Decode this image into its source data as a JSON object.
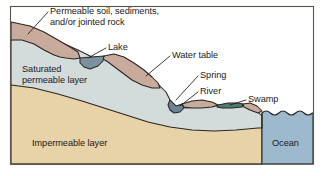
{
  "figure": {
    "background_color": "#ffffff",
    "frame_color": "#585249"
  },
  "layers": [
    {
      "id": "permeable-soil",
      "label": "Permeable soil, sediments,\nand/or jointed rock",
      "label_line_1": "Permeable soil, sediments,",
      "label_line_2": "and/or jointed rock",
      "color": "#c9ab9c",
      "label_placement": "external-leader"
    },
    {
      "id": "saturated-permeable",
      "label": "Saturated\npermeable layer",
      "label_line_1": "Saturated",
      "label_line_2": "permeable layer",
      "color": "#d3dbdb",
      "label_placement": "internal"
    },
    {
      "id": "impermeable",
      "label": "Impermeable layer",
      "label_line_1": "Impermeable layer",
      "color": "#e8d2a8",
      "label_placement": "internal"
    }
  ],
  "water_bodies": [
    {
      "id": "lake",
      "label": "Lake",
      "color": "#7b91a0"
    },
    {
      "id": "river",
      "label": "River",
      "color": "#6b8496"
    },
    {
      "id": "swamp",
      "label": "Swamp",
      "color": "#4e7a74"
    },
    {
      "id": "ocean",
      "label": "Ocean",
      "color": "#9cb9ce"
    }
  ],
  "features": [
    {
      "id": "water-table",
      "label": "Water table"
    },
    {
      "id": "spring",
      "label": "Spring"
    }
  ],
  "labels": {
    "permeable_soil_l1": "Permeable soil, sediments,",
    "permeable_soil_l2": "and/or jointed rock",
    "lake": "Lake",
    "water_table": "Water table",
    "spring": "Spring",
    "river": "River",
    "swamp": "Swamp",
    "ocean": "Ocean",
    "saturated_l1": "Saturated",
    "saturated_l2": "permeable layer",
    "impermeable": "Impermeable layer"
  },
  "colors": {
    "outline": "#2b2521",
    "text": "#1a1a1a",
    "permeable_soil": "#c9ab9c",
    "saturated": "#d3dbdb",
    "impermeable": "#e8d2a8",
    "ocean": "#9cb9ce",
    "lake": "#7b91a0",
    "river": "#6b8496",
    "swamp": "#4e7a74",
    "frame": "#585249",
    "background": "#ffffff"
  }
}
